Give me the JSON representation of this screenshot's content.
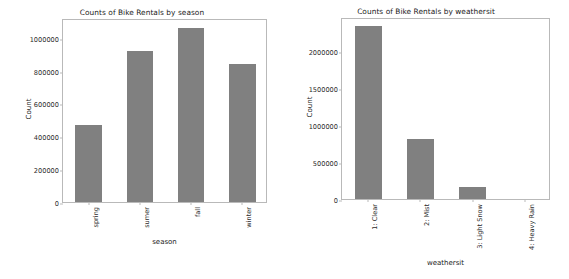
{
  "figure": {
    "background": "#ffffff",
    "bar_color": "#808080",
    "spine_color": "#b9b9b9",
    "text_color": "#1a1a1a"
  },
  "chart_data": [
    {
      "type": "bar",
      "title": "Counts of Bike Rentals by season",
      "xlabel": "season",
      "ylabel": "Count",
      "categories": [
        "spring",
        "sumer",
        "fall",
        "winter"
      ],
      "values": [
        471348,
        918589,
        1061129,
        841613
      ],
      "yticks": [
        0,
        200000,
        400000,
        600000,
        800000,
        1000000
      ],
      "ytick_labels": [
        "0",
        "200000",
        "400000",
        "600000",
        "800000",
        "1000000"
      ],
      "ylim": [
        0,
        1120000
      ],
      "grid": false,
      "legend": "none",
      "xtick_rotation": 90,
      "bar_color": "#808080"
    },
    {
      "type": "bar",
      "title": "Counts of Bike Rentals by weathersit",
      "xlabel": "weathersit",
      "ylabel": "Count",
      "categories": [
        "1: Clear",
        "2: Mist",
        "3: Light Snow",
        "4: Heavy Rain"
      ],
      "values": [
        2338173,
        813189,
        158331,
        223
      ],
      "yticks": [
        0,
        500000,
        1000000,
        1500000,
        2000000
      ],
      "ytick_labels": [
        "0",
        "500000",
        "1000000",
        "1500000",
        "2000000"
      ],
      "ylim": [
        0,
        2460000
      ],
      "grid": false,
      "legend": "none",
      "xtick_rotation": 90,
      "bar_color": "#808080"
    }
  ]
}
